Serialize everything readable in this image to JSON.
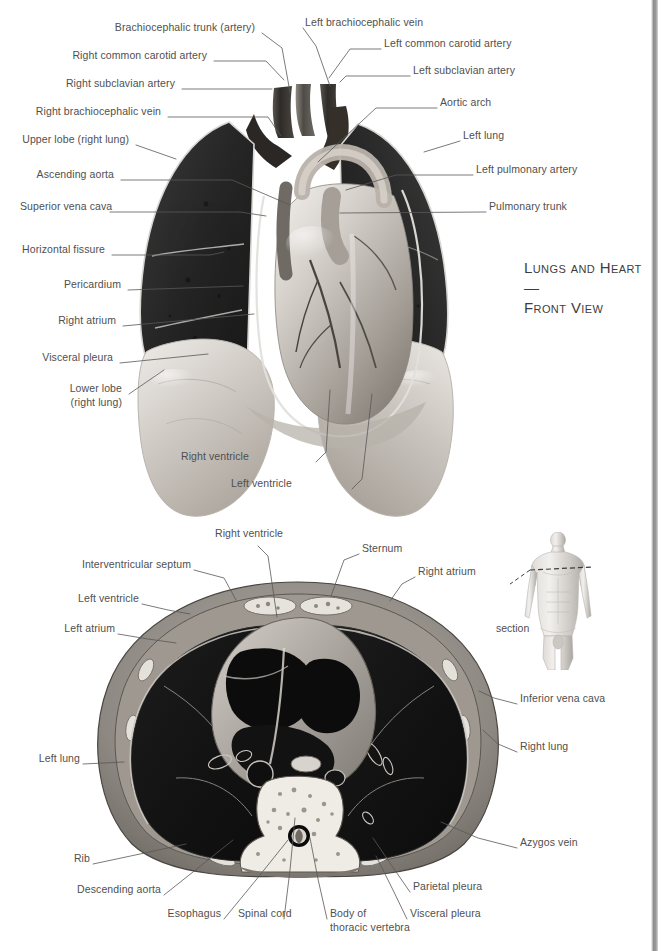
{
  "page": {
    "width": 666,
    "height": 951,
    "background": "#ffffff",
    "text_color": "#4f4f4f",
    "line_color": "#5a5a5a"
  },
  "figure_title": {
    "line1": "Lungs and Heart—",
    "line2": "Front View"
  },
  "figures": {
    "top": {
      "name": "lungs-and-heart-front-view",
      "caption": "Anterior view of thoracic cavity showing both lungs and the heart with great vessels"
    },
    "bottom": {
      "name": "thorax-cross-section",
      "caption": "Transverse (axial) section of the thorax at the level of the heart"
    },
    "body": {
      "name": "body-orientation-diagram",
      "section_label": "section",
      "caption": "Whole-body figure with dashed line indicating the level of the transverse section"
    }
  },
  "top_labels": [
    {
      "id": "brachiocephalic-trunk",
      "text": "Brachiocephalic trunk (artery)",
      "align": "right",
      "x": 255,
      "y": 27,
      "anchor": [
        262,
        33
      ],
      "target": [
        290,
        93
      ]
    },
    {
      "id": "left-brachiocephalic-vein",
      "text": "Left brachiocephalic vein",
      "align": "left",
      "x": 305,
      "y": 22,
      "anchor": [
        303,
        28
      ],
      "target": [
        330,
        88
      ]
    },
    {
      "id": "right-common-carotid-artery",
      "text": "Right common carotid artery",
      "align": "right",
      "x": 207,
      "y": 55,
      "anchor": [
        214,
        61
      ],
      "target": [
        283,
        81
      ]
    },
    {
      "id": "left-common-carotid-artery",
      "text": "Left common carotid artery",
      "align": "left",
      "x": 384,
      "y": 43,
      "anchor": [
        381,
        49
      ],
      "target": [
        327,
        79
      ]
    },
    {
      "id": "right-subclavian-artery",
      "text": "Right subclavian artery",
      "align": "right",
      "x": 175,
      "y": 83,
      "anchor": [
        182,
        89
      ],
      "target": [
        272,
        89
      ]
    },
    {
      "id": "left-subclavian-artery",
      "text": "Left subclavian artery",
      "align": "left",
      "x": 413,
      "y": 70,
      "anchor": [
        410,
        76
      ],
      "target": [
        340,
        82
      ]
    },
    {
      "id": "right-brachiocephalic-vein",
      "text": "Right brachiocephalic vein",
      "align": "right",
      "x": 161,
      "y": 111,
      "anchor": [
        168,
        117
      ],
      "target": [
        279,
        136
      ]
    },
    {
      "id": "aortic-arch",
      "text": "Aortic arch",
      "align": "left",
      "x": 440,
      "y": 102,
      "anchor": [
        437,
        108
      ],
      "target": [
        318,
        163
      ]
    },
    {
      "id": "upper-lobe-right-lung",
      "text": "Upper lobe (right lung)",
      "align": "right",
      "x": 129,
      "y": 139,
      "anchor": [
        136,
        145
      ],
      "target": [
        175,
        160
      ]
    },
    {
      "id": "left-lung",
      "text": "Left lung",
      "align": "left",
      "x": 463,
      "y": 135,
      "anchor": [
        460,
        141
      ],
      "target": [
        424,
        153
      ]
    },
    {
      "id": "ascending-aorta",
      "text": "Ascending aorta",
      "align": "right",
      "x": 114,
      "y": 174,
      "anchor": [
        121,
        180
      ],
      "target": [
        290,
        206
      ]
    },
    {
      "id": "left-pulmonary-artery",
      "text": "Left pulmonary artery",
      "align": "left",
      "x": 476,
      "y": 169,
      "anchor": [
        473,
        175
      ],
      "target": [
        345,
        190
      ]
    },
    {
      "id": "superior-vena-cava",
      "text": "Superior vena cava",
      "align": "right",
      "x": 103,
      "y": 206,
      "anchor": [
        110,
        212
      ],
      "target": [
        266,
        216
      ]
    },
    {
      "id": "pulmonary-trunk",
      "text": "Pulmonary trunk",
      "align": "left",
      "x": 489,
      "y": 206,
      "anchor": [
        486,
        212
      ],
      "target": [
        340,
        214
      ]
    },
    {
      "id": "horizontal-fissure",
      "text": "Horizontal fissure",
      "align": "right",
      "x": 105,
      "y": 249,
      "anchor": [
        112,
        255
      ],
      "target": [
        222,
        254
      ]
    },
    {
      "id": "pericardium",
      "text": "Pericardium",
      "align": "right",
      "x": 121,
      "y": 284,
      "anchor": [
        128,
        290
      ],
      "target": [
        243,
        286
      ]
    },
    {
      "id": "right-atrium",
      "text": "Right atrium",
      "align": "right",
      "x": 116,
      "y": 320,
      "anchor": [
        123,
        326
      ],
      "target": [
        254,
        315
      ]
    },
    {
      "id": "visceral-pleura",
      "text": "Visceral pleura",
      "align": "right",
      "x": 113,
      "y": 357,
      "anchor": [
        120,
        363
      ],
      "target": [
        207,
        355
      ]
    },
    {
      "id": "lower-lobe-right-lung-l1",
      "text": "Lower lobe",
      "align": "right",
      "x": 122,
      "y": 388,
      "anchor": [
        129,
        394
      ],
      "target": [
        163,
        371
      ]
    },
    {
      "id": "lower-lobe-right-lung-l2",
      "text": "(right lung)",
      "align": "right",
      "x": 122,
      "y": 402,
      "anchor": null,
      "target": null
    },
    {
      "id": "right-ventricle-top",
      "text": "Right ventricle",
      "align": "right",
      "x": 249,
      "y": 456,
      "anchor": [
        316,
        462
      ],
      "target": [
        330,
        391
      ]
    },
    {
      "id": "left-ventricle-top",
      "text": "Left ventricle",
      "align": "right",
      "x": 292,
      "y": 483,
      "anchor": [
        352,
        489
      ],
      "target": [
        372,
        395
      ]
    }
  ],
  "bottom_labels": [
    {
      "id": "right-ventricle-bottom",
      "text": "Right ventricle",
      "align": "left",
      "x": 215,
      "y": 533,
      "anchor": [
        258,
        546
      ],
      "target": [
        277,
        618
      ]
    },
    {
      "id": "sternum",
      "text": "Sternum",
      "align": "left",
      "x": 362,
      "y": 548,
      "anchor": [
        359,
        554
      ],
      "target": [
        330,
        597
      ]
    },
    {
      "id": "interventricular-septum",
      "text": "Interventricular septum",
      "align": "right",
      "x": 91,
      "y": 564,
      "anchor": [
        194,
        570
      ],
      "target": [
        234,
        601
      ]
    },
    {
      "id": "right-atrium-bottom",
      "text": "Right atrium",
      "align": "left",
      "x": 418,
      "y": 571,
      "anchor": [
        415,
        577
      ],
      "target": [
        390,
        602
      ]
    },
    {
      "id": "left-ventricle-bottom",
      "text": "Left ventricle",
      "align": "right",
      "x": 86,
      "y": 598,
      "anchor": [
        142,
        604
      ],
      "target": [
        190,
        614
      ]
    },
    {
      "id": "left-atrium",
      "text": "Left atrium",
      "align": "right",
      "x": 62,
      "y": 628,
      "anchor": [
        118,
        634
      ],
      "target": [
        175,
        643
      ]
    },
    {
      "id": "inferior-vena-cava",
      "text": "Inferior vena cava",
      "align": "left",
      "x": 520,
      "y": 698,
      "anchor": [
        517,
        704
      ],
      "target": [
        480,
        692
      ]
    },
    {
      "id": "right-lung-bottom",
      "text": "Right lung",
      "align": "left",
      "x": 520,
      "y": 746,
      "anchor": [
        517,
        752
      ],
      "target": [
        483,
        730
      ]
    },
    {
      "id": "left-lung-bottom",
      "text": "Left lung",
      "align": "right",
      "x": 40,
      "y": 758,
      "anchor": [
        83,
        764
      ],
      "target": [
        124,
        762
      ]
    },
    {
      "id": "azygos-vein",
      "text": "Azygos vein",
      "align": "left",
      "x": 520,
      "y": 842,
      "anchor": [
        517,
        848
      ],
      "target": [
        440,
        822
      ]
    },
    {
      "id": "rib",
      "text": "Rib",
      "align": "right",
      "x": 70,
      "y": 858,
      "anchor": [
        93,
        864
      ],
      "target": [
        185,
        844
      ]
    },
    {
      "id": "parietal-pleura",
      "text": "Parietal pleura",
      "align": "left",
      "x": 413,
      "y": 886,
      "anchor": [
        410,
        892
      ],
      "target": [
        372,
        838
      ]
    },
    {
      "id": "descending-aorta",
      "text": "Descending aorta",
      "align": "right",
      "x": 86,
      "y": 889,
      "anchor": [
        164,
        895
      ],
      "target": [
        232,
        840
      ]
    },
    {
      "id": "visceral-pleura-bottom",
      "text": "Visceral pleura",
      "align": "left",
      "x": 410,
      "y": 913,
      "anchor": [
        407,
        919
      ],
      "target": [
        375,
        856
      ]
    },
    {
      "id": "esophagus",
      "text": "Esophagus",
      "align": "right",
      "x": 167,
      "y": 913,
      "anchor": [
        224,
        919
      ],
      "target": [
        288,
        840
      ]
    },
    {
      "id": "spinal-cord",
      "text": "Spinal cord",
      "align": "left",
      "x": 238,
      "y": 913,
      "anchor": [
        284,
        919
      ],
      "target": [
        295,
        818
      ]
    },
    {
      "id": "body-of-thoracic-vertebra-l1",
      "text": "Body of",
      "align": "left",
      "x": 330,
      "y": 913,
      "anchor": [
        327,
        919
      ],
      "target": [
        309,
        838
      ]
    },
    {
      "id": "body-of-thoracic-vertebra-l2",
      "text": "thoracic vertebra",
      "align": "left",
      "x": 330,
      "y": 927,
      "anchor": null,
      "target": null
    }
  ]
}
